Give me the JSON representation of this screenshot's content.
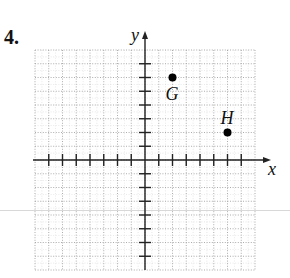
{
  "problem": {
    "number": "4."
  },
  "chart_data": {
    "type": "scatter",
    "title": "",
    "xlabel": "x",
    "ylabel": "y",
    "xlim": [
      -8,
      8
    ],
    "ylim": [
      -8,
      8
    ],
    "grid": true,
    "tick_labels": false,
    "points": [
      {
        "label": "G",
        "x": 2,
        "y": 6
      },
      {
        "label": "H",
        "x": 6,
        "y": 2
      }
    ],
    "x_ticks": [
      -7,
      -6,
      -5,
      -4,
      -3,
      -2,
      -1,
      1,
      2,
      3,
      4,
      5,
      6,
      7
    ],
    "y_ticks": [
      -7,
      -6,
      -5,
      -4,
      -3,
      -2,
      -1,
      1,
      2,
      3,
      4,
      5,
      6,
      7
    ]
  },
  "colors": {
    "axis": "#222222",
    "grid": "#9a9a9a",
    "point": "#000000"
  }
}
